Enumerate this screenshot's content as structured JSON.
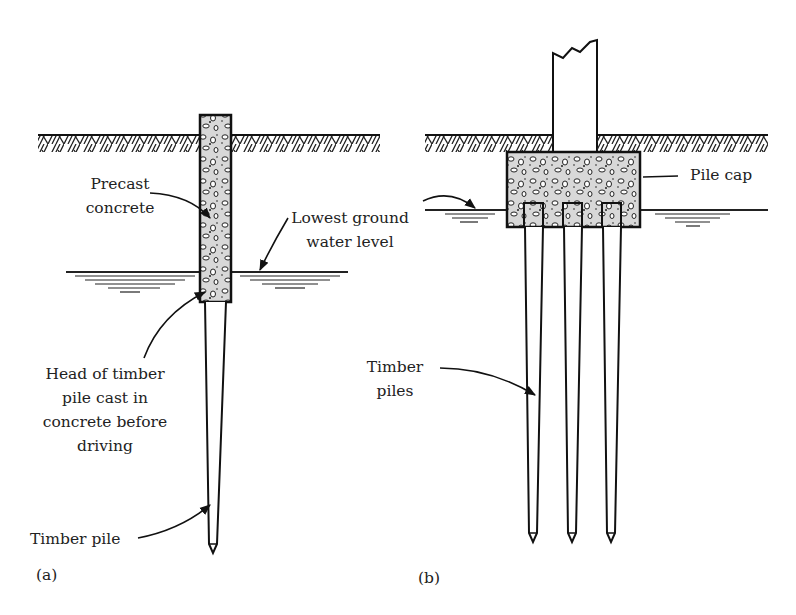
{
  "figure": {
    "type": "engineering-diagram",
    "colors": {
      "ink": "#1a1a1a",
      "background": "#ffffff"
    }
  },
  "panel_a": {
    "tag": "(a)",
    "labels": {
      "precast_line1": "Precast",
      "precast_line2": "concrete",
      "water_line1": "Lowest ground",
      "water_line2": "water level",
      "head_line1": "Head of timber",
      "head_line2": "pile cast in",
      "head_line3": "concrete before",
      "head_line4": "driving",
      "pile": "Timber pile"
    }
  },
  "panel_b": {
    "tag": "(b)",
    "labels": {
      "pile_cap": "Pile cap",
      "piles_line1": "Timber",
      "piles_line2": "piles"
    },
    "pile_count": 3
  }
}
